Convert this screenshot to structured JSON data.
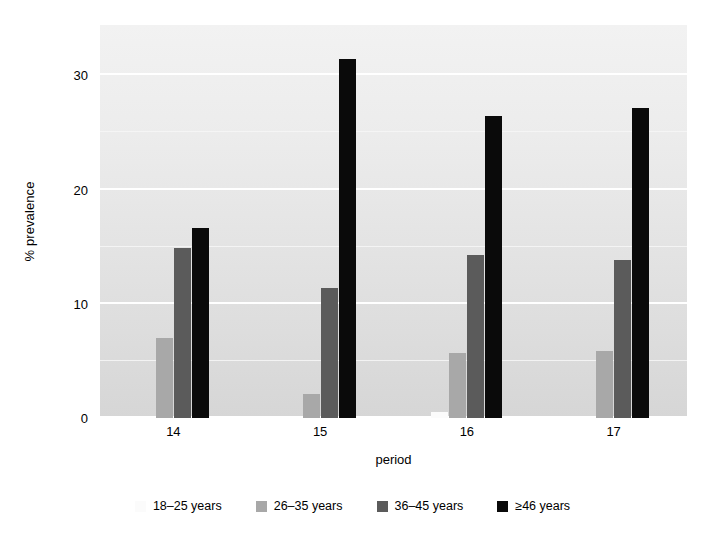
{
  "chart_data": {
    "type": "bar",
    "title": "",
    "subtitle": "",
    "xlabel": "period",
    "ylabel": "% prevalence",
    "categories": [
      "14",
      "15",
      "16",
      "17"
    ],
    "yticks": [
      "0",
      "10",
      "20",
      "30"
    ],
    "ytick_values": [
      0,
      10,
      20,
      30
    ],
    "ylim": [
      0,
      34.4
    ],
    "grid": true,
    "grid_orientation": "horizontal",
    "legend_position": "bottom",
    "series": [
      {
        "name": "18–25 years",
        "color": "#fbfbfb",
        "values": [
          0,
          0,
          0.5,
          0
        ]
      },
      {
        "name": "26–35 years",
        "color": "#a8a8a8",
        "values": [
          7.0,
          2.1,
          5.7,
          5.9
        ]
      },
      {
        "name": "36–45 years",
        "color": "#5b5b5b",
        "values": [
          14.9,
          11.4,
          14.3,
          13.8
        ]
      },
      {
        "name": "≥46 years",
        "color": "#0a0a0a",
        "values": [
          16.6,
          31.4,
          26.4,
          27.1
        ]
      }
    ]
  },
  "legend": {
    "items": [
      {
        "label": "18–25 years",
        "swatch": "#fbfbfb"
      },
      {
        "label": "26–35 years",
        "swatch": "#a8a8a8"
      },
      {
        "label": "36–45 years",
        "swatch": "#5b5b5b"
      },
      {
        "label": "≥46 years",
        "swatch": "#0a0a0a"
      }
    ]
  },
  "axes": {
    "x_title": "period",
    "y_title": "% prevalence"
  }
}
